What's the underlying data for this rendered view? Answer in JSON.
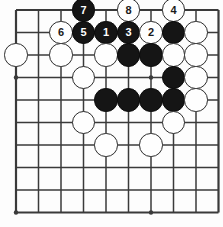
{
  "figure": {
    "board": {
      "cols": 10,
      "rows": 10,
      "origin_x": 16,
      "origin_y": 10,
      "spacing": 22.5,
      "line_color": "#3a3a3a",
      "line_width": 1.5,
      "edge_line_width": 2.2,
      "background": "#fdfdfd",
      "star_points": [
        {
          "col": 0,
          "row": 3
        },
        {
          "col": 0,
          "row": 9
        },
        {
          "col": 6,
          "row": 3
        },
        {
          "col": 6,
          "row": 9
        }
      ]
    },
    "colors": {
      "black_stone": "#151515",
      "white_stone": "#fefefe",
      "stone_outline": "#2b2b2b",
      "black_label": "#ffffff",
      "white_label": "#1a1a1a"
    },
    "stones": [
      {
        "col": 3,
        "row": 0,
        "color": "black",
        "label": "7"
      },
      {
        "col": 5,
        "row": 0,
        "color": "white",
        "label": "8"
      },
      {
        "col": 7,
        "row": 0,
        "color": "white",
        "label": "4"
      },
      {
        "col": 2,
        "row": 1,
        "color": "white",
        "label": "6"
      },
      {
        "col": 3,
        "row": 1,
        "color": "black",
        "label": "5"
      },
      {
        "col": 4,
        "row": 1,
        "color": "black",
        "label": "1"
      },
      {
        "col": 5,
        "row": 1,
        "color": "black",
        "label": "3"
      },
      {
        "col": 6,
        "row": 1,
        "color": "white",
        "label": "2"
      },
      {
        "col": 7,
        "row": 1,
        "color": "black",
        "label": ""
      },
      {
        "col": 8,
        "row": 1,
        "color": "white",
        "label": ""
      },
      {
        "col": 0,
        "row": 2,
        "color": "white",
        "label": ""
      },
      {
        "col": 2,
        "row": 2,
        "color": "white",
        "label": ""
      },
      {
        "col": 4,
        "row": 2,
        "color": "white",
        "label": ""
      },
      {
        "col": 5,
        "row": 2,
        "color": "black",
        "label": ""
      },
      {
        "col": 6,
        "row": 2,
        "color": "black",
        "label": ""
      },
      {
        "col": 7,
        "row": 2,
        "color": "white",
        "label": ""
      },
      {
        "col": 8,
        "row": 2,
        "color": "white",
        "label": ""
      },
      {
        "col": 3,
        "row": 3,
        "color": "white",
        "label": ""
      },
      {
        "col": 7,
        "row": 3,
        "color": "black",
        "label": ""
      },
      {
        "col": 8,
        "row": 3,
        "color": "white",
        "label": ""
      },
      {
        "col": 4,
        "row": 4,
        "color": "black",
        "label": ""
      },
      {
        "col": 5,
        "row": 4,
        "color": "black",
        "label": ""
      },
      {
        "col": 6,
        "row": 4,
        "color": "black",
        "label": ""
      },
      {
        "col": 7,
        "row": 4,
        "color": "black",
        "label": ""
      },
      {
        "col": 8,
        "row": 4,
        "color": "white",
        "label": ""
      },
      {
        "col": 3,
        "row": 5,
        "color": "white",
        "label": ""
      },
      {
        "col": 7,
        "row": 5,
        "color": "white",
        "label": ""
      },
      {
        "col": 4,
        "row": 6,
        "color": "white",
        "label": ""
      },
      {
        "col": 6,
        "row": 6,
        "color": "white",
        "label": ""
      }
    ],
    "move_sequence": [
      "1",
      "2",
      "3",
      "4",
      "5",
      "6",
      "7",
      "8"
    ]
  }
}
